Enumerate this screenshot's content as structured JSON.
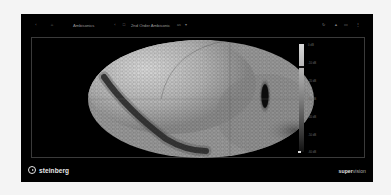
{
  "toolbar": {
    "left_icons": [
      {
        "name": "back-icon",
        "glyph": "‹"
      },
      {
        "name": "pin-icon",
        "glyph": "⌂"
      }
    ],
    "module_name": "Ambisonics",
    "channel_icon": {
      "name": "channel-format-icon",
      "glyph": "□"
    },
    "format_dropdown": {
      "value": "2nd Order Ambisonic",
      "suffix": "as",
      "arrow": "▾"
    },
    "right_icons": [
      {
        "name": "reset-icon",
        "glyph": "↻"
      },
      {
        "name": "hold-icon",
        "glyph": "▲"
      },
      {
        "name": "layout-icon",
        "glyph": "▭"
      },
      {
        "name": "more-icon",
        "glyph": "⋮"
      }
    ]
  },
  "visualization": {
    "type": "ambisonics-sphere-heatmap",
    "projection": "hammer-aitoff ellipse",
    "colors": {
      "high": "#d6d6d6",
      "mid": "#8a8a8a",
      "low": "#111111",
      "background": "#000000"
    }
  },
  "color_scale": {
    "labels": [
      "0 dB",
      "-10 dB",
      "-20 dB",
      "-30 dB",
      "-40 dB",
      "-50 dB",
      "-60 dB"
    ],
    "marker_positions": [
      0.21,
      0.73
    ],
    "bottom_marker": "◂"
  },
  "footer": {
    "brand": "steinberg",
    "product_bold": "super",
    "product_light": "vision"
  }
}
